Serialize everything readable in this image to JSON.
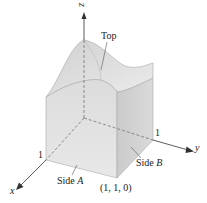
{
  "diagram": {
    "axes": {
      "x_label": "x",
      "y_label": "y",
      "z_label": "z",
      "x_tick": "1",
      "y_tick": "1"
    },
    "labels": {
      "top": "Top",
      "side_a_word": "Side",
      "side_a_letter": "A",
      "side_b_word": "Side",
      "side_b_letter": "B",
      "corner_point": "(1, 1, 0)"
    },
    "colors": {
      "axis": "#333333",
      "face_left": "#d9d9d9",
      "face_right": "#cfcfcf",
      "top_surface": "#e6e6e6",
      "edge": "#999999"
    }
  }
}
